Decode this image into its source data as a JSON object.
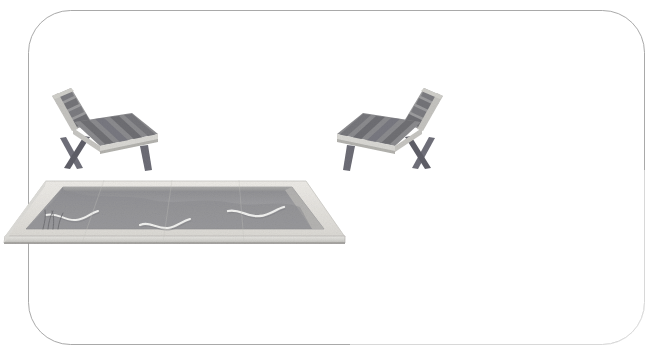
{
  "illustration": {
    "title": "Reflecting pool with two wooden lounge chairs",
    "style": "minimal architectural rendering",
    "background_color": "#ffffff",
    "canvas": {
      "width": 653,
      "height": 357
    }
  },
  "frame": {
    "name": "rounded-rectangle-frame",
    "stroke_color": "#9a9a9a",
    "stroke_width": 1,
    "fill": "none",
    "x": 28,
    "y": 10,
    "width": 617,
    "height": 335,
    "corner_radius": 42
  },
  "pool": {
    "label": "reflecting pool",
    "coping_color": "#e3e2de",
    "coping_edge_color": "#c9c8c3",
    "water_color": "#97979a",
    "water_shadow_color": "#8a8a8e",
    "inner_wall_color": "#b4b3b1",
    "front_edge_color": "#cfcecb",
    "ripple_color": "#f2f2f0",
    "outline": {
      "back_left_x": 46,
      "back_left_y": 181,
      "back_right_x": 306,
      "back_right_y": 181,
      "front_right_x": 345,
      "front_right_y": 237,
      "front_left_x": 5,
      "front_right2_y": 237
    },
    "ripples": [
      {
        "name": "ripple-left",
        "cx": 68,
        "cy": 218
      },
      {
        "name": "ripple-center",
        "cx": 162,
        "cy": 224
      },
      {
        "name": "ripple-right",
        "cx": 250,
        "cy": 214
      }
    ],
    "reeds": {
      "name": "reed-grass-tuft",
      "x": 50,
      "y": 228,
      "count": 4
    }
  },
  "chairs": [
    {
      "name": "lounge-chair-left",
      "orientation": "facing-right",
      "frame_color": "#b9b8b4",
      "slat_color": "#7b7b7e",
      "slat_dark_color": "#6d6d70",
      "seat_edge_color": "#d6d5d1",
      "leg_color": "#6f6f72",
      "backrest_color": "#8b8b8d",
      "x": 48,
      "y": 86,
      "width": 115,
      "height": 83,
      "slat_count": 6
    },
    {
      "name": "lounge-chair-right",
      "orientation": "facing-left",
      "frame_color": "#b9b8b4",
      "slat_color": "#7b7b7e",
      "slat_dark_color": "#6d6d70",
      "seat_edge_color": "#d6d5d1",
      "leg_color": "#6f6f72",
      "backrest_color": "#8b8b8d",
      "x": 190,
      "y": 86,
      "width": 115,
      "height": 83,
      "slat_count": 6
    }
  ]
}
